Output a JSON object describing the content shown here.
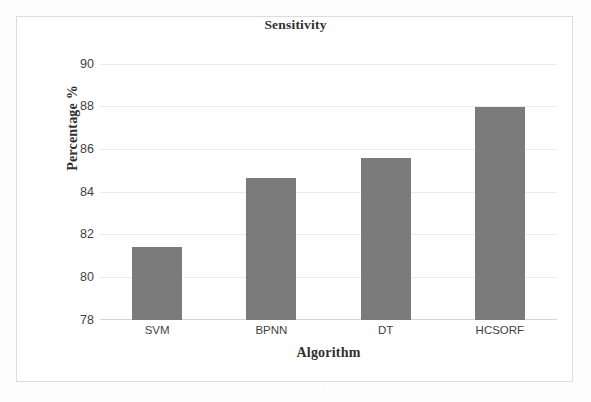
{
  "chart_data": {
    "type": "bar",
    "title": "Sensitivity",
    "xlabel": "Algorithm",
    "ylabel": "Percentage %",
    "categories": [
      "SVM",
      "BPNN",
      "DT",
      "HCSORF"
    ],
    "values": [
      81.4,
      84.65,
      85.6,
      88.0
    ],
    "series": [
      {
        "name": "Sensitivity",
        "values": [
          81.4,
          84.65,
          85.6,
          88.0
        ]
      }
    ],
    "ylim": [
      78,
      90
    ],
    "yticks": [
      78,
      80,
      82,
      84,
      86,
      88,
      90
    ],
    "ytick_labels": [
      "78",
      "80",
      "82",
      "84",
      "86",
      "88",
      "90"
    ],
    "grid": true,
    "legend": false,
    "legend_position": "none",
    "bar_color": "#7b7b7b",
    "gridline_color": "#ececec",
    "axis_color": "#d5d5d5",
    "text_color": "#303030",
    "tick_color": "#3f3f3f",
    "background_color": "#ffffff",
    "frame_color": "#dcdcdc"
  }
}
